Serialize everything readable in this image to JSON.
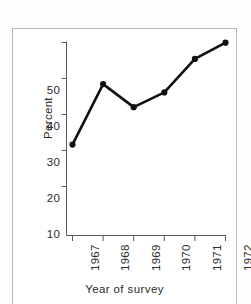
{
  "figure": {
    "background_color": "#ffffff",
    "frame_color": "#b9b9b9",
    "series_color": "#111111"
  },
  "axes": {
    "y_title": "Percent",
    "x_title": "Year of survey",
    "y_ticks": [
      "10",
      "20",
      "30",
      "40",
      "50"
    ],
    "x_ticks": [
      "1967",
      "1968",
      "1969",
      "1970",
      "1971",
      "1972"
    ]
  },
  "chart_data": {
    "type": "line",
    "title": "",
    "subtitle": "",
    "xlabel": "Year of survey",
    "ylabel": "Percent",
    "categories": [
      "1967",
      "1968",
      "1969",
      "1970",
      "1971",
      "1972"
    ],
    "x": [
      1967,
      1968,
      1969,
      1970,
      1971,
      1972
    ],
    "values": [
      21.5,
      38.3,
      31.9,
      36.0,
      45.3,
      49.8
    ],
    "series": [
      {
        "name": "Percent",
        "values": [
          21.5,
          38.3,
          31.9,
          36.0,
          45.3,
          49.8
        ]
      }
    ],
    "ylim": [
      0,
      52
    ],
    "ytick_values": [
      10,
      20,
      30,
      40,
      50
    ],
    "xlim": [
      1966.5,
      1972.5
    ],
    "grid": false,
    "legend": "none",
    "markers": "filled-circle",
    "line_width": 2.6,
    "annotations": []
  }
}
